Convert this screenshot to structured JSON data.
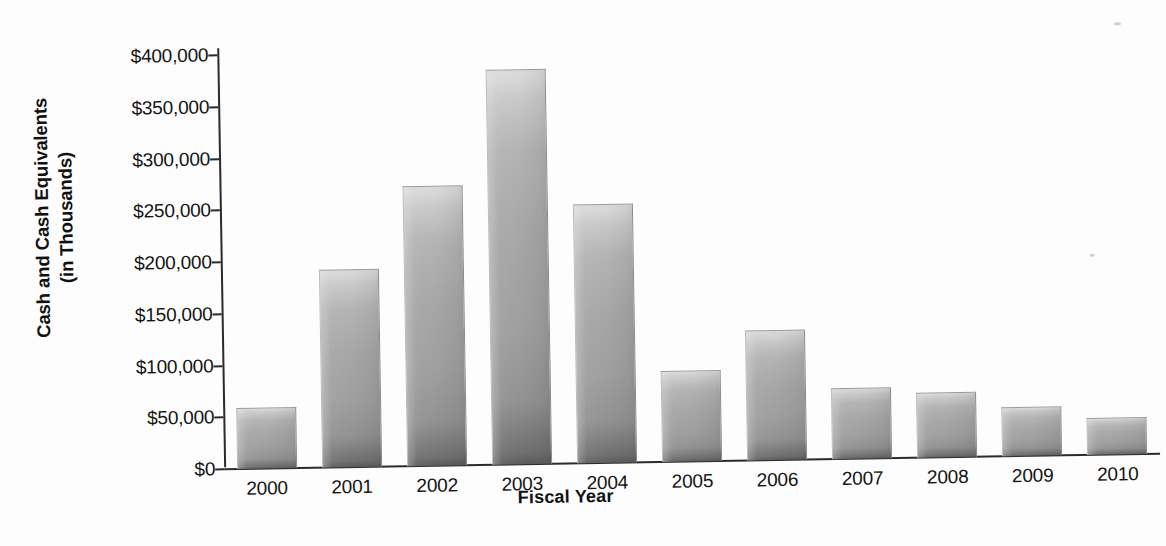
{
  "chart_data": {
    "type": "bar",
    "title": "",
    "xlabel": "Fiscal Year",
    "ylabel": "Cash and Cash Equivalents (in Thousands)",
    "ylabel_line1": "Cash and Cash Equivalents",
    "ylabel_line2": "(in Thousands)",
    "categories": [
      "2000",
      "2001",
      "2002",
      "2003",
      "2004",
      "2005",
      "2006",
      "2007",
      "2008",
      "2009",
      "2010"
    ],
    "values": [
      58000,
      190000,
      270000,
      381000,
      249000,
      87000,
      125000,
      68000,
      62000,
      46000,
      35000
    ],
    "ylim": [
      0,
      400000
    ],
    "ytick_values": [
      0,
      50000,
      100000,
      150000,
      200000,
      250000,
      300000,
      350000,
      400000
    ],
    "ytick_labels": [
      "$0",
      "$50,000",
      "$100,000",
      "$150,000",
      "$200,000",
      "$250,000",
      "$300,000",
      "$350,000",
      "$400,000"
    ],
    "grid": false,
    "legend": null,
    "legend_position": "none",
    "bar_color": "#a6a6a6",
    "axis_color": "#2b2b2b",
    "background_color": "#fdfdfd"
  }
}
